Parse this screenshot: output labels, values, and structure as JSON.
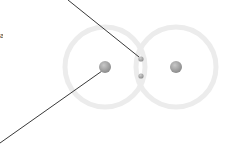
{
  "diagram": {
    "type": "covalent-bond-atom-model",
    "colors": {
      "background": "#ffffff",
      "orbital_ring": "#ececec",
      "nucleus": "#9a9a9a",
      "nucleus_highlight": "#c8c8c8",
      "electron": "#a0a0a0",
      "leader_line": "#222222"
    },
    "atoms": [
      {
        "name": "left-atom",
        "nucleus": {
          "cx": 105,
          "cy": 67,
          "r": 6
        },
        "orbital": {
          "cx": 105,
          "cy": 67,
          "r": 40
        }
      },
      {
        "name": "right-atom",
        "nucleus": {
          "cx": 176,
          "cy": 67,
          "r": 6
        },
        "orbital": {
          "cx": 176,
          "cy": 67,
          "r": 40
        }
      }
    ],
    "shared_electrons": [
      {
        "cx": 141,
        "cy": 59,
        "r": 2.6
      },
      {
        "cx": 141,
        "cy": 76,
        "r": 2.6
      }
    ],
    "leader_lines": [
      {
        "name": "electron-pointer",
        "x1": 68,
        "y1": 0,
        "x2": 139,
        "y2": 57
      },
      {
        "name": "nucleus-pointer",
        "x1": 102,
        "y1": 71,
        "x2": 0,
        "y2": 143
      }
    ],
    "edge_text_fragment": "a"
  }
}
